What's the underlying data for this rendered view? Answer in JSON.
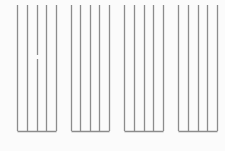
{
  "diagram": {
    "line_color": "#8c8c8c",
    "background": "#fbfbfb",
    "top_y": 5,
    "base_y": 131,
    "groups": [
      {
        "id": "group-1",
        "xs": [
          17,
          27,
          37,
          46,
          56
        ],
        "gap": {
          "line_index": 2,
          "y_start": 55,
          "y_end": 59
        }
      },
      {
        "id": "group-2",
        "xs": [
          71,
          80,
          90,
          99,
          109
        ]
      },
      {
        "id": "group-3",
        "xs": [
          124,
          134,
          144,
          153,
          163
        ]
      },
      {
        "id": "group-4",
        "xs": [
          178,
          188,
          198,
          207,
          217
        ]
      }
    ]
  }
}
